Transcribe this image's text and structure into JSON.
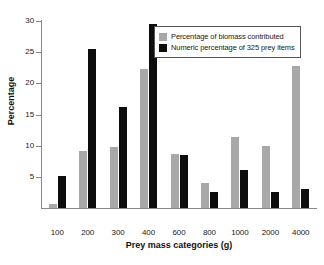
{
  "chart_data": {
    "type": "bar",
    "title": "",
    "xlabel": "Prey mass categories (g)",
    "ylabel": "Percentage",
    "categories": [
      "100",
      "200",
      "300",
      "400",
      "600",
      "800",
      "1000",
      "2000",
      "4000"
    ],
    "series": [
      {
        "name": "Percentage of biomass contributed",
        "color": "#a8a8a8",
        "values": [
          0.6,
          9.1,
          9.8,
          22.3,
          8.6,
          4.0,
          11.4,
          10.0,
          22.8
        ]
      },
      {
        "name": "Numeric percentage of 325 prey items",
        "color": "#0d0d0d",
        "values": [
          5.1,
          25.5,
          16.2,
          29.5,
          8.5,
          2.6,
          6.1,
          2.6,
          3.0
        ]
      }
    ],
    "ylim": [
      0,
      30
    ],
    "yticks": [
      5,
      10,
      15,
      20,
      25,
      30
    ],
    "grid": false,
    "legend_position": "top-right"
  },
  "legend": {
    "entries": [
      {
        "label": "Percentage of biomass contributed",
        "swatch": "grey"
      },
      {
        "label": "Numeric percentage of 325 prey items",
        "swatch": "black"
      }
    ]
  },
  "axes": {
    "y_title": "Percentage",
    "x_title": "Prey mass categories (g)",
    "y_tick_labels": [
      "30",
      "25",
      "20",
      "15",
      "10",
      "5"
    ],
    "x_tick_labels": [
      "100",
      "200",
      "300",
      "400",
      "600",
      "800",
      "1000",
      "2000",
      "4000"
    ]
  },
  "caption": ""
}
